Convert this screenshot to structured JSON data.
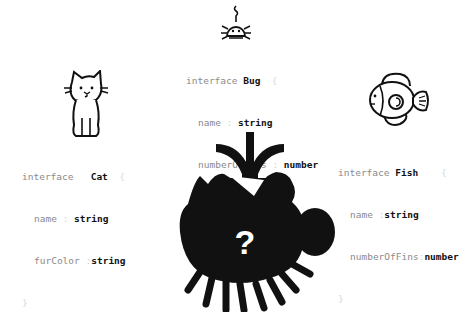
{
  "interfaces": {
    "bug": {
      "keyword": "interface",
      "name": "Bug",
      "open": "{",
      "close": "}",
      "props": [
        {
          "name": "name",
          "type": "string"
        },
        {
          "name": "numberOfLegs",
          "type": "number"
        },
        {
          "name": "hasWings",
          "type": "boolean"
        }
      ],
      "icon": "bug-icon"
    },
    "cat": {
      "keyword": "interface",
      "name": "Cat",
      "open": "{",
      "close": "}",
      "props": [
        {
          "name": "name",
          "type": "string"
        },
        {
          "name": "furColor",
          "type": "string"
        }
      ],
      "icon": "cat-icon"
    },
    "fish": {
      "keyword": "interface",
      "name": "Fish",
      "open": "{",
      "close": "}",
      "props": [
        {
          "name": "name",
          "type": "string"
        },
        {
          "name": "numberOfFins",
          "type": "number"
        }
      ],
      "icon": "fish-icon"
    }
  },
  "merged": {
    "symbol": "?",
    "icon": "unknown-hybrid-creature-icon",
    "arrow": "merge-arrow-icon"
  },
  "colon": ":"
}
